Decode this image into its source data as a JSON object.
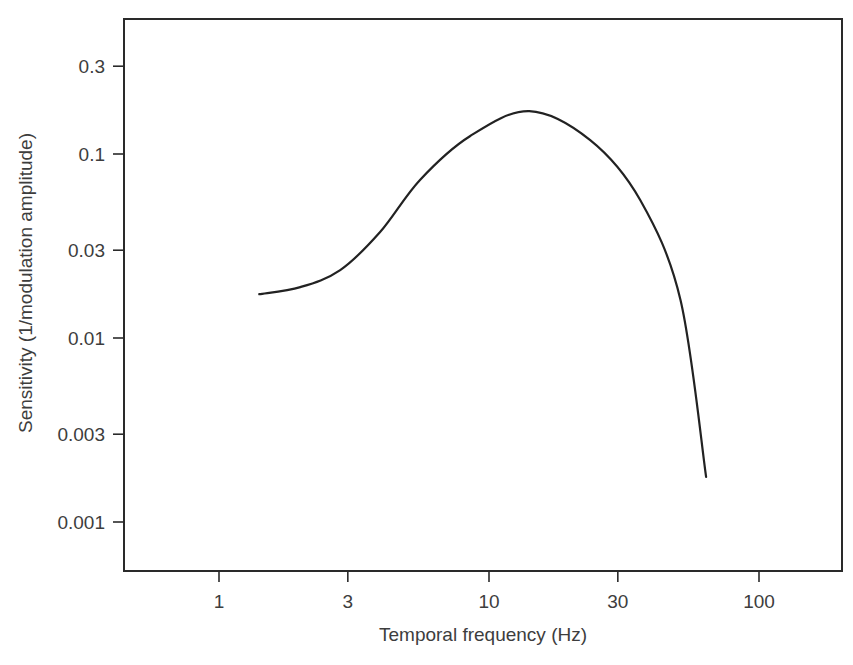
{
  "chart_data": {
    "type": "line",
    "title": "",
    "xlabel": "Temporal frequency (Hz)",
    "ylabel": "Sensitivity (1/modulation amplitude)",
    "xscale": "log",
    "yscale": "log",
    "xlim": [
      0.5,
      180
    ],
    "ylim": [
      0.00055,
      0.5
    ],
    "xticks": [
      1,
      3,
      10,
      30,
      100
    ],
    "xtick_labels": [
      "1",
      "3",
      "10",
      "30",
      "100"
    ],
    "yticks": [
      0.001,
      0.003,
      0.01,
      0.03,
      0.1,
      0.3
    ],
    "ytick_labels": [
      "0.001",
      "0.003",
      "0.01",
      "0.03",
      "0.1",
      "0.3"
    ],
    "grid": false,
    "legend": null,
    "series": [
      {
        "name": "Temporal contrast sensitivity",
        "color": "#222222",
        "x": [
          1.41,
          2.0,
          2.81,
          3.95,
          5.55,
          8.5,
          14.1,
          23.7,
          36.3,
          51.2,
          63.7
        ],
        "y": [
          0.0173,
          0.0189,
          0.0234,
          0.0377,
          0.0723,
          0.125,
          0.171,
          0.119,
          0.0562,
          0.0161,
          0.00176
        ]
      }
    ]
  }
}
